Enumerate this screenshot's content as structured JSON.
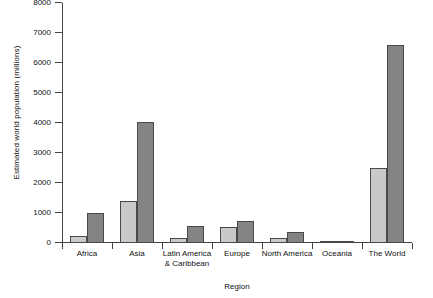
{
  "chart_data": {
    "type": "bar",
    "title": "",
    "xlabel": "Region",
    "ylabel": "Estimated world population (millions)",
    "categories": [
      "Africa",
      "Asia",
      "Latin America\n& Caribbean",
      "Europe",
      "North America",
      "Oceania",
      "The World"
    ],
    "category_lines": [
      [
        "Africa"
      ],
      [
        "Asia"
      ],
      [
        "Latin America",
        "& Caribbean"
      ],
      [
        "Europe"
      ],
      [
        "North America"
      ],
      [
        "Oceania"
      ],
      [
        "The World"
      ]
    ],
    "series": [
      {
        "name": "light",
        "color": "#c9c9c9",
        "values": [
          230,
          1400,
          170,
          550,
          170,
          20,
          2500
        ]
      },
      {
        "name": "dark",
        "color": "#848484",
        "values": [
          1000,
          4050,
          580,
          720,
          360,
          40,
          6600
        ]
      }
    ],
    "ylim": [
      0,
      8000
    ],
    "yticks": [
      0,
      1000,
      2000,
      3000,
      4000,
      5000,
      6000,
      7000,
      8000
    ],
    "ytick_labels": [
      "0",
      "1000",
      "2000",
      "3000",
      "4000",
      "5000",
      "6000",
      "7000",
      "8000"
    ],
    "grid": false,
    "legend": "none"
  }
}
